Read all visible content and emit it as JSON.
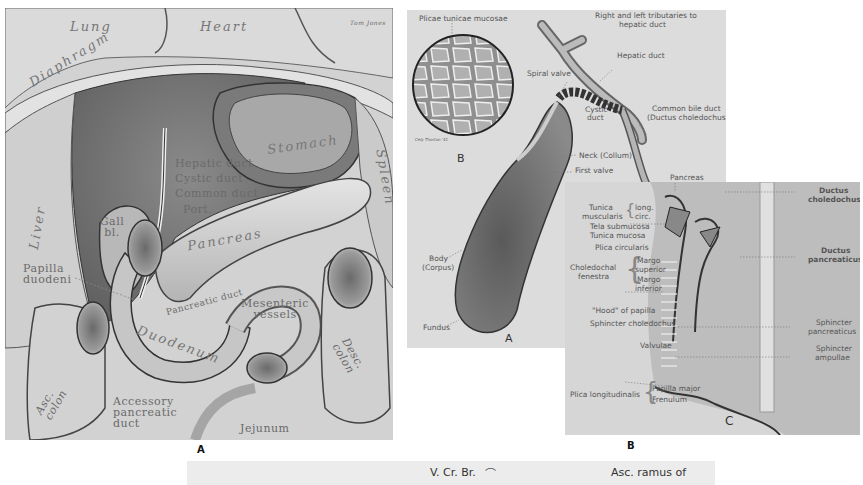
{
  "figure_a": {
    "letter": "A",
    "labels": {
      "lung": "Lung",
      "heart": "Heart",
      "signature": "Tom Jones",
      "diaphragm": "Diaphragm",
      "liver": "Liver",
      "stomach": "Stomach",
      "spleen": "Spleen",
      "hepatic_duct": "Hepatic duct",
      "cystic_duct": "Cystic duct",
      "common_duct": "Common duct",
      "portal": "Port.",
      "gall_bladder": "Gall bl.",
      "pancreas": "Pancreas",
      "pancreatic_duct": "Pancreatic duct",
      "papilla_duodeni": "Papilla duodeni",
      "mesenteric_vessels": "Mesenteric vessels",
      "duodenum": "Duodenum",
      "asc_colon": "Asc. colon",
      "desc_colon": "Desc. colon",
      "accessory_pancreatic_duct": "Accessory pancreatic duct",
      "jejunum": "Jejunum"
    }
  },
  "figure_b": {
    "letter": "B",
    "inset_letter": "B",
    "sub_letter_a": "A",
    "labels": {
      "plicae": "Plicae tunicae mucosae",
      "tributaries_1": "Right and left tributaries to",
      "tributaries_2": "hepatic duct",
      "hepatic_duct": "Hepatic duct",
      "spiral_valve": "Spiral valve",
      "cystic_duct_1": "Cystic",
      "cystic_duct_2": "duct",
      "common_bile_1": "Common bile duct",
      "common_bile_2": "(Ductus choledochus)",
      "neck": "Neck (Collum)",
      "first_valve": "First valve",
      "body_1": "Body",
      "body_2": "(Corpus)",
      "fundus": "Fundus",
      "artist": "Cely Thorton '41"
    }
  },
  "figure_c": {
    "letter": "C",
    "labels": {
      "pancreas": "Pancreas",
      "ductus_choledochus_1": "Ductus",
      "ductus_choledochus_2": "choledochus",
      "ductus_pancreaticus_1": "Ductus",
      "ductus_pancreaticus_2": "pancreaticus",
      "tunica_muscularis_1": "Tunica",
      "tunica_muscularis_2": "muscularis",
      "long": "long.",
      "circ": "circ.",
      "tela_submucosa": "Tela submucosa",
      "tunica_mucosa": "Tunica mucosa",
      "plica_circularis": "Plica circularis",
      "choledochal_1": "Choledochal",
      "choledochal_2": "fenestra",
      "margo_superior_1": "Margo",
      "margo_superior_2": "superior",
      "margo_inferior_1": "Margo",
      "margo_inferior_2": "inferior",
      "hood": "\"Hood\" of papilla",
      "sphincter_choledochus": "Sphincter choledochus",
      "valvulae": "Valvulae",
      "sphincter_pancreaticus_1": "Sphincter",
      "sphincter_pancreaticus_2": "pancreaticus",
      "sphincter_ampullae_1": "Sphincter",
      "sphincter_ampullae_2": "ampullae",
      "plica_longitudinalis": "Plica longitudinalis",
      "papilla_major": "Papilla major",
      "frenulum": "Frenulum"
    }
  },
  "bottom_strip": {
    "left_label": "V. Cr. Br.",
    "right_label": "Asc. ramus of"
  }
}
